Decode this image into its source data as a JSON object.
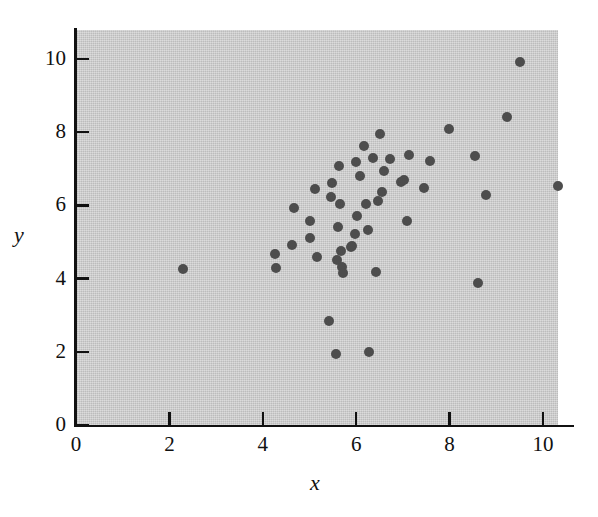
{
  "chart_data": {
    "type": "scatter",
    "title": "",
    "subtitle": "",
    "xlabel": "x",
    "ylabel": "y",
    "xlim": [
      0,
      10.35
    ],
    "ylim": [
      0,
      10.8
    ],
    "xticks": [
      0,
      2,
      4,
      6,
      8,
      10
    ],
    "xticklabels": [
      "0",
      "2",
      "4",
      "6",
      "8",
      "10"
    ],
    "yticks": [
      0,
      2,
      4,
      6,
      8,
      10
    ],
    "yticklabels": [
      "0",
      "2",
      "4",
      "6",
      "8",
      "10"
    ],
    "grid": false,
    "legend": null,
    "annotations": [],
    "marker": {
      "shape": "circle",
      "color": "#4d4d4d",
      "size": 10
    },
    "plot_background_color": "#c9c9c9",
    "figure_background_color": "#ffffff",
    "axis_color": "#111111",
    "series": [
      {
        "name": "observations",
        "points": [
          [
            2.3,
            4.25
          ],
          [
            4.26,
            4.68
          ],
          [
            4.29,
            4.3
          ],
          [
            4.63,
            4.93
          ],
          [
            4.67,
            5.92
          ],
          [
            5.0,
            5.1
          ],
          [
            5.02,
            5.58
          ],
          [
            5.12,
            6.45
          ],
          [
            5.15,
            4.6
          ],
          [
            5.42,
            2.84
          ],
          [
            5.46,
            6.22
          ],
          [
            5.48,
            6.62
          ],
          [
            5.57,
            1.95
          ],
          [
            5.58,
            4.5
          ],
          [
            5.6,
            5.4
          ],
          [
            5.64,
            7.08
          ],
          [
            5.66,
            6.03
          ],
          [
            5.68,
            4.76
          ],
          [
            5.7,
            4.32
          ],
          [
            5.72,
            4.16
          ],
          [
            5.88,
            4.87
          ],
          [
            5.92,
            4.9
          ],
          [
            5.97,
            5.22
          ],
          [
            6.0,
            7.18
          ],
          [
            6.02,
            5.72
          ],
          [
            6.08,
            6.8
          ],
          [
            6.17,
            7.62
          ],
          [
            6.22,
            6.05
          ],
          [
            6.25,
            5.32
          ],
          [
            6.28,
            1.99
          ],
          [
            6.35,
            7.3
          ],
          [
            6.42,
            4.18
          ],
          [
            6.47,
            6.12
          ],
          [
            6.52,
            7.95
          ],
          [
            6.55,
            6.37
          ],
          [
            6.6,
            6.95
          ],
          [
            6.72,
            7.28
          ],
          [
            6.95,
            6.65
          ],
          [
            7.02,
            6.7
          ],
          [
            7.08,
            5.58
          ],
          [
            7.12,
            7.38
          ],
          [
            7.45,
            6.48
          ],
          [
            7.58,
            7.2
          ],
          [
            7.98,
            8.1
          ],
          [
            8.55,
            7.35
          ],
          [
            8.6,
            3.88
          ],
          [
            8.78,
            6.28
          ],
          [
            9.22,
            8.42
          ],
          [
            9.5,
            9.92
          ],
          [
            10.32,
            6.52
          ]
        ]
      }
    ]
  }
}
